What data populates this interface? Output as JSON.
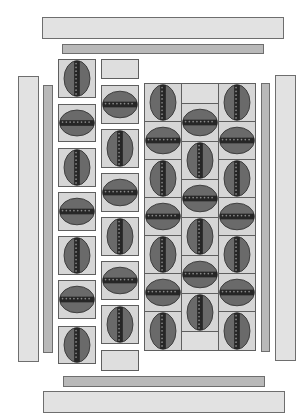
{
  "diagram": {
    "type": "tile-layout",
    "colors": {
      "background": "#ffffff",
      "light_bar": "#e2e2e2",
      "mid_bar": "#b9b9b9",
      "tile_bg": "#d6d6d6",
      "ellipse": "#6a6a6a",
      "seam": "#262626",
      "stroke": "#5f5f5f"
    },
    "bars": [
      {
        "id": "top-outer-bar",
        "x": 42,
        "y": 17,
        "w": 242,
        "h": 22,
        "style": "light"
      },
      {
        "id": "top-inner-bar",
        "x": 62,
        "y": 44,
        "w": 202,
        "h": 10,
        "style": "mid"
      },
      {
        "id": "left-outer-bar",
        "x": 18,
        "y": 76,
        "w": 21,
        "h": 286,
        "style": "light"
      },
      {
        "id": "left-inner-bar",
        "x": 43,
        "y": 85,
        "w": 10,
        "h": 268,
        "style": "mid"
      },
      {
        "id": "right-inner-bar",
        "x": 261,
        "y": 83,
        "w": 9,
        "h": 269,
        "style": "mid"
      },
      {
        "id": "right-outer-bar",
        "x": 275,
        "y": 75,
        "w": 21,
        "h": 286,
        "style": "light"
      },
      {
        "id": "bottom-inner-bar",
        "x": 63,
        "y": 376,
        "w": 202,
        "h": 11,
        "style": "mid"
      },
      {
        "id": "bottom-outer-bar",
        "x": 43,
        "y": 391,
        "w": 242,
        "h": 22,
        "style": "light"
      }
    ],
    "tiles": [
      {
        "x": 58,
        "y": 59,
        "w": 38,
        "h": 39,
        "kind": "vertical"
      },
      {
        "x": 58,
        "y": 104,
        "w": 38,
        "h": 38,
        "kind": "horizontal"
      },
      {
        "x": 58,
        "y": 148,
        "w": 38,
        "h": 39,
        "kind": "vertical"
      },
      {
        "x": 58,
        "y": 192,
        "w": 38,
        "h": 39,
        "kind": "horizontal"
      },
      {
        "x": 58,
        "y": 236,
        "w": 38,
        "h": 39,
        "kind": "vertical"
      },
      {
        "x": 58,
        "y": 280,
        "w": 38,
        "h": 39,
        "kind": "horizontal"
      },
      {
        "x": 58,
        "y": 326,
        "w": 38,
        "h": 38,
        "kind": "vertical"
      },
      {
        "x": 101,
        "y": 59,
        "w": 38,
        "h": 20,
        "kind": "blank"
      },
      {
        "x": 101,
        "y": 85,
        "w": 38,
        "h": 39,
        "kind": "horizontal"
      },
      {
        "x": 101,
        "y": 129,
        "w": 38,
        "h": 39,
        "kind": "vertical"
      },
      {
        "x": 101,
        "y": 173,
        "w": 38,
        "h": 39,
        "kind": "horizontal"
      },
      {
        "x": 101,
        "y": 217,
        "w": 38,
        "h": 39,
        "kind": "vertical"
      },
      {
        "x": 101,
        "y": 261,
        "w": 38,
        "h": 39,
        "kind": "horizontal"
      },
      {
        "x": 101,
        "y": 305,
        "w": 38,
        "h": 39,
        "kind": "vertical"
      },
      {
        "x": 101,
        "y": 350,
        "w": 38,
        "h": 21,
        "kind": "blank"
      },
      {
        "x": 144,
        "y": 83,
        "w": 38,
        "h": 39,
        "kind": "vertical"
      },
      {
        "x": 144,
        "y": 121,
        "w": 38,
        "h": 39,
        "kind": "horizontal"
      },
      {
        "x": 144,
        "y": 159,
        "w": 38,
        "h": 39,
        "kind": "vertical"
      },
      {
        "x": 144,
        "y": 197,
        "w": 38,
        "h": 39,
        "kind": "horizontal"
      },
      {
        "x": 144,
        "y": 235,
        "w": 38,
        "h": 39,
        "kind": "vertical"
      },
      {
        "x": 144,
        "y": 273,
        "w": 38,
        "h": 39,
        "kind": "horizontal"
      },
      {
        "x": 144,
        "y": 311,
        "w": 38,
        "h": 40,
        "kind": "vertical"
      },
      {
        "x": 181,
        "y": 83,
        "w": 38,
        "h": 21,
        "kind": "blank"
      },
      {
        "x": 181,
        "y": 103,
        "w": 38,
        "h": 39,
        "kind": "horizontal"
      },
      {
        "x": 181,
        "y": 141,
        "w": 38,
        "h": 39,
        "kind": "vertical"
      },
      {
        "x": 181,
        "y": 179,
        "w": 38,
        "h": 39,
        "kind": "horizontal"
      },
      {
        "x": 181,
        "y": 217,
        "w": 38,
        "h": 39,
        "kind": "vertical"
      },
      {
        "x": 181,
        "y": 255,
        "w": 38,
        "h": 39,
        "kind": "horizontal"
      },
      {
        "x": 181,
        "y": 293,
        "w": 38,
        "h": 39,
        "kind": "vertical"
      },
      {
        "x": 181,
        "y": 331,
        "w": 38,
        "h": 20,
        "kind": "blank"
      },
      {
        "x": 218,
        "y": 83,
        "w": 38,
        "h": 39,
        "kind": "vertical"
      },
      {
        "x": 218,
        "y": 121,
        "w": 38,
        "h": 39,
        "kind": "horizontal"
      },
      {
        "x": 218,
        "y": 159,
        "w": 38,
        "h": 39,
        "kind": "vertical"
      },
      {
        "x": 218,
        "y": 197,
        "w": 38,
        "h": 39,
        "kind": "horizontal"
      },
      {
        "x": 218,
        "y": 235,
        "w": 38,
        "h": 39,
        "kind": "vertical"
      },
      {
        "x": 218,
        "y": 273,
        "w": 38,
        "h": 39,
        "kind": "horizontal"
      },
      {
        "x": 218,
        "y": 311,
        "w": 38,
        "h": 40,
        "kind": "vertical"
      }
    ]
  }
}
